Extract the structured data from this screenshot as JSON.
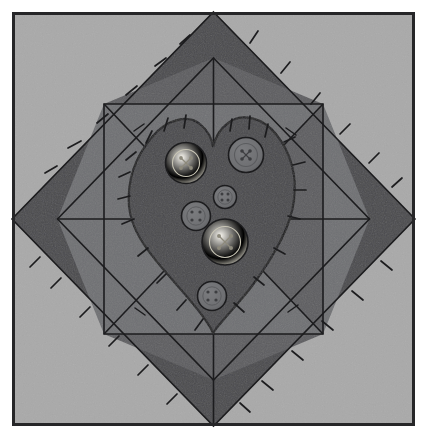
{
  "artwork": {
    "title": "Quilt Block With Appliqued Heart",
    "kind": "quilt-block-illustration",
    "canvas": {
      "width": 427,
      "height": 440
    }
  },
  "palette": {
    "page_background": "#ffffff",
    "frame_line": "#262628",
    "background_cloth": "#a9a9a9",
    "border_diamond": "#4a4a4d",
    "inner_field": "#5d5d60",
    "star_triangle": "#6f7073",
    "heart_fabric": "#4a4a4d",
    "button_light": "#eceadf",
    "button_dark": "#6f7073",
    "stitch_line": "#1c1c1e",
    "seam_line": "#1c1c1e"
  },
  "frame": {
    "label": "outer-frame",
    "x": 12,
    "y": 12,
    "width": 403,
    "height": 414,
    "stroke_width": 3
  },
  "border_diamond": {
    "label": "dark-border-diamond",
    "center_x": 213.5,
    "center_y": 219,
    "outer_radius_x": 201,
    "outer_radius_y": 207,
    "band_thickness": 46
  },
  "inner_field": {
    "label": "inner-diamond-field",
    "center_x": 213.5,
    "center_y": 219,
    "radius_x": 156,
    "radius_y": 161
  },
  "star_triangles": [
    {
      "name": "star-triangle-top",
      "points": "57.5,104 369.5,104 213.5,219"
    },
    {
      "name": "star-triangle-right",
      "points": "323,58 323,380 213.5,219"
    },
    {
      "name": "star-triangle-bottom",
      "points": "57.5,334 369.5,334 213.5,219"
    },
    {
      "name": "star-triangle-left",
      "points": "104,58 104,380 213.5,219"
    }
  ],
  "seams": [
    {
      "name": "seam-vertical",
      "x1": 213.5,
      "y1": 12,
      "x2": 213.5,
      "y2": 426
    },
    {
      "name": "seam-horizontal",
      "x1": 12,
      "y1": 219,
      "x2": 415,
      "y2": 219
    }
  ],
  "heart": {
    "label": "appliqued-heart",
    "fill": "#4a4a4d",
    "outline": "#1c1c1e",
    "tip_x": 213,
    "tip_y": 333,
    "top_y": 118
  },
  "buttons": [
    {
      "name": "button-cream-upper-left",
      "cx": 186,
      "cy": 163,
      "r": 20.5,
      "tone": "light",
      "holes": 4
    },
    {
      "name": "button-dark-upper-right",
      "cx": 246,
      "cy": 155,
      "r": 17.5,
      "tone": "dark",
      "holes": 4
    },
    {
      "name": "button-dark-center-small",
      "cx": 225,
      "cy": 197,
      "r": 11.5,
      "tone": "dark",
      "holes": 4
    },
    {
      "name": "button-dark-mid-left",
      "cx": 196,
      "cy": 216,
      "r": 14.5,
      "tone": "dark",
      "holes": 4
    },
    {
      "name": "button-cream-lower-center",
      "cx": 225,
      "cy": 242,
      "r": 23,
      "tone": "light",
      "holes": 4
    },
    {
      "name": "button-dark-bottom",
      "cx": 212,
      "cy": 296,
      "r": 14.5,
      "tone": "dark",
      "holes": 4
    }
  ],
  "stitch_marks": {
    "label": "hand-stitch-tick-marks",
    "stroke": "#1c1c1e",
    "count_border": 28,
    "count_heart": 18
  }
}
